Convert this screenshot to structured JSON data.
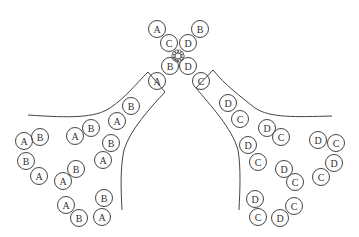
{
  "figure": {
    "width": 359,
    "height": 237,
    "stroke_color": "#444444",
    "circle_radius": 8.5
  },
  "junction": {
    "knot": {
      "x": 178,
      "y": 56
    },
    "circles": [
      {
        "label": "A",
        "x": 157,
        "y": 29
      },
      {
        "label": "C",
        "x": 169,
        "y": 43
      },
      {
        "label": "D",
        "x": 188,
        "y": 43
      },
      {
        "label": "B",
        "x": 200,
        "y": 29
      },
      {
        "label": "B",
        "x": 170,
        "y": 66
      },
      {
        "label": "D",
        "x": 188,
        "y": 66
      },
      {
        "label": "A",
        "x": 157,
        "y": 81
      },
      {
        "label": "C",
        "x": 201,
        "y": 81
      }
    ]
  },
  "left_cluster": {
    "circles": [
      {
        "label": "A",
        "x": 24,
        "y": 141
      },
      {
        "label": "B",
        "x": 40,
        "y": 137
      },
      {
        "label": "A",
        "x": 75,
        "y": 136
      },
      {
        "label": "B",
        "x": 91,
        "y": 128
      },
      {
        "label": "A",
        "x": 117,
        "y": 121
      },
      {
        "label": "B",
        "x": 131,
        "y": 106
      },
      {
        "label": "B",
        "x": 26,
        "y": 161
      },
      {
        "label": "A",
        "x": 39,
        "y": 176
      },
      {
        "label": "A",
        "x": 63,
        "y": 181
      },
      {
        "label": "B",
        "x": 76,
        "y": 169
      },
      {
        "label": "A",
        "x": 103,
        "y": 160
      },
      {
        "label": "B",
        "x": 111,
        "y": 143
      },
      {
        "label": "A",
        "x": 66,
        "y": 205
      },
      {
        "label": "B",
        "x": 79,
        "y": 218
      },
      {
        "label": "B",
        "x": 104,
        "y": 198
      },
      {
        "label": "A",
        "x": 102,
        "y": 217
      }
    ]
  },
  "right_cluster": {
    "circles": [
      {
        "label": "D",
        "x": 228,
        "y": 103
      },
      {
        "label": "C",
        "x": 240,
        "y": 119
      },
      {
        "label": "D",
        "x": 267,
        "y": 128
      },
      {
        "label": "C",
        "x": 281,
        "y": 137
      },
      {
        "label": "D",
        "x": 248,
        "y": 145
      },
      {
        "label": "C",
        "x": 258,
        "y": 162
      },
      {
        "label": "D",
        "x": 284,
        "y": 169
      },
      {
        "label": "C",
        "x": 295,
        "y": 182
      },
      {
        "label": "D",
        "x": 318,
        "y": 140
      },
      {
        "label": "C",
        "x": 336,
        "y": 143
      },
      {
        "label": "D",
        "x": 334,
        "y": 163
      },
      {
        "label": "C",
        "x": 321,
        "y": 177
      },
      {
        "label": "D",
        "x": 255,
        "y": 199
      },
      {
        "label": "C",
        "x": 258,
        "y": 217
      },
      {
        "label": "C",
        "x": 294,
        "y": 206
      },
      {
        "label": "D",
        "x": 280,
        "y": 218
      }
    ]
  },
  "boundaries": {
    "left_outer": "M 28 115 C 70 118, 95 118, 110 108 C 125 98, 135 85, 148 72",
    "left_channel_top": "M 148 72 L 165 92",
    "left_inner": "M 165 92 C 150 108, 130 130, 124 150 C 120 168, 121 190, 122 210",
    "right_outer": "M 332 116 C 295 117, 270 118, 255 108 C 240 96, 225 85, 213 70",
    "right_channel_top": "M 213 70 L 196 88",
    "right_inner": "M 196 88 C 210 105, 232 128, 238 150 C 241 168, 240 190, 239 210"
  }
}
